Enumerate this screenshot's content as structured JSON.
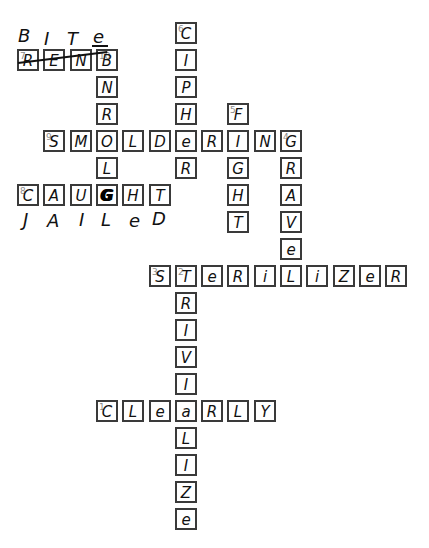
{
  "crossword": {
    "entries": [
      {
        "number": 1,
        "direction": "across",
        "answer": "CLEARLY",
        "row": 14,
        "col": 3
      },
      {
        "number": 2,
        "direction": "down",
        "answer": "TRIVIALIZE",
        "row": 9,
        "col": 6
      },
      {
        "number": 3,
        "direction": "across",
        "answer": "STERILIZER",
        "row": 9,
        "col": 5
      },
      {
        "number": 4,
        "direction": "down",
        "answer": "GRAVEL",
        "row": 4,
        "col": 10
      },
      {
        "number": 5,
        "direction": "down",
        "answer": "FIGHT",
        "row": 3,
        "col": 8
      },
      {
        "number": 6,
        "direction": "down",
        "answer": "CIPHER",
        "row": 0,
        "col": 6
      },
      {
        "number": 7,
        "direction": "across",
        "answer": "REND",
        "row": 1,
        "col": 0,
        "struck_through": true,
        "correction": "BITE"
      },
      {
        "number": 8,
        "direction": "across",
        "answer": "CAUGHT",
        "row": 6,
        "col": 0,
        "correction": "JAILED"
      },
      {
        "number": 9,
        "direction": "across",
        "answer": "SMOLDERING",
        "row": 4,
        "col": 1
      },
      {
        "number": 10,
        "direction": "down",
        "answer": "BNROLG",
        "row": 1,
        "col": 3
      }
    ],
    "cells": [
      {
        "r": 0,
        "c": 6,
        "letter": "C",
        "num": "6"
      },
      {
        "r": 1,
        "c": 0,
        "letter": "R",
        "num": "7"
      },
      {
        "r": 1,
        "c": 1,
        "letter": "E"
      },
      {
        "r": 1,
        "c": 2,
        "letter": "N"
      },
      {
        "r": 1,
        "c": 3,
        "letter": "B",
        "num": "10"
      },
      {
        "r": 1,
        "c": 6,
        "letter": "I"
      },
      {
        "r": 2,
        "c": 3,
        "letter": "N"
      },
      {
        "r": 2,
        "c": 6,
        "letter": "P"
      },
      {
        "r": 3,
        "c": 3,
        "letter": "R"
      },
      {
        "r": 3,
        "c": 6,
        "letter": "H"
      },
      {
        "r": 3,
        "c": 8,
        "letter": "F",
        "num": "5"
      },
      {
        "r": 4,
        "c": 1,
        "letter": "S",
        "num": "9"
      },
      {
        "r": 4,
        "c": 2,
        "letter": "M"
      },
      {
        "r": 4,
        "c": 3,
        "letter": "O"
      },
      {
        "r": 4,
        "c": 4,
        "letter": "L"
      },
      {
        "r": 4,
        "c": 5,
        "letter": "D"
      },
      {
        "r": 4,
        "c": 6,
        "letter": "e"
      },
      {
        "r": 4,
        "c": 7,
        "letter": "R"
      },
      {
        "r": 4,
        "c": 8,
        "letter": "I"
      },
      {
        "r": 4,
        "c": 9,
        "letter": "N"
      },
      {
        "r": 4,
        "c": 10,
        "letter": "G",
        "num": "4"
      },
      {
        "r": 5,
        "c": 3,
        "letter": "L"
      },
      {
        "r": 5,
        "c": 6,
        "letter": "R"
      },
      {
        "r": 5,
        "c": 8,
        "letter": "G"
      },
      {
        "r": 5,
        "c": 10,
        "letter": "R"
      },
      {
        "r": 6,
        "c": 0,
        "letter": "C",
        "num": "8"
      },
      {
        "r": 6,
        "c": 1,
        "letter": "A"
      },
      {
        "r": 6,
        "c": 2,
        "letter": "U"
      },
      {
        "r": 6,
        "c": 3,
        "letter": "G",
        "scribbled": true
      },
      {
        "r": 6,
        "c": 4,
        "letter": "H"
      },
      {
        "r": 6,
        "c": 5,
        "letter": "T"
      },
      {
        "r": 6,
        "c": 8,
        "letter": "H"
      },
      {
        "r": 6,
        "c": 10,
        "letter": "A"
      },
      {
        "r": 7,
        "c": 8,
        "letter": "T"
      },
      {
        "r": 7,
        "c": 10,
        "letter": "V"
      },
      {
        "r": 8,
        "c": 10,
        "letter": "e"
      },
      {
        "r": 9,
        "c": 5,
        "letter": "S",
        "num": "3"
      },
      {
        "r": 9,
        "c": 6,
        "letter": "T",
        "num": "2"
      },
      {
        "r": 9,
        "c": 7,
        "letter": "e"
      },
      {
        "r": 9,
        "c": 8,
        "letter": "R"
      },
      {
        "r": 9,
        "c": 9,
        "letter": "i"
      },
      {
        "r": 9,
        "c": 10,
        "letter": "L"
      },
      {
        "r": 9,
        "c": 11,
        "letter": "i"
      },
      {
        "r": 9,
        "c": 12,
        "letter": "Z"
      },
      {
        "r": 9,
        "c": 13,
        "letter": "e"
      },
      {
        "r": 9,
        "c": 14,
        "letter": "R"
      },
      {
        "r": 10,
        "c": 6,
        "letter": "R"
      },
      {
        "r": 11,
        "c": 6,
        "letter": "I"
      },
      {
        "r": 12,
        "c": 6,
        "letter": "V"
      },
      {
        "r": 13,
        "c": 6,
        "letter": "I"
      },
      {
        "r": 14,
        "c": 3,
        "letter": "C",
        "num": "1"
      },
      {
        "r": 14,
        "c": 4,
        "letter": "L"
      },
      {
        "r": 14,
        "c": 5,
        "letter": "e"
      },
      {
        "r": 14,
        "c": 6,
        "letter": "a"
      },
      {
        "r": 14,
        "c": 7,
        "letter": "R"
      },
      {
        "r": 14,
        "c": 8,
        "letter": "L"
      },
      {
        "r": 14,
        "c": 9,
        "letter": "Y"
      },
      {
        "r": 15,
        "c": 6,
        "letter": "L"
      },
      {
        "r": 16,
        "c": 6,
        "letter": "I"
      },
      {
        "r": 17,
        "c": 6,
        "letter": "Z"
      },
      {
        "r": 18,
        "c": 6,
        "letter": "e"
      }
    ],
    "corrections": {
      "above_7_across": {
        "text": "BITE",
        "letters": [
          {
            "ch": "B",
            "x": 18,
            "y": 27
          },
          {
            "ch": "I",
            "x": 44,
            "y": 30
          },
          {
            "ch": "T",
            "x": 67,
            "y": 30
          },
          {
            "ch": "e",
            "x": 93,
            "y": 28
          }
        ]
      },
      "below_8_across": {
        "text": "JAILED",
        "letters": [
          {
            "ch": "J",
            "x": 23,
            "y": 211
          },
          {
            "ch": "A",
            "x": 47,
            "y": 212
          },
          {
            "ch": "I",
            "x": 79,
            "y": 211
          },
          {
            "ch": "L",
            "x": 101,
            "y": 211
          },
          {
            "ch": "e",
            "x": 129,
            "y": 212
          },
          {
            "ch": "D",
            "x": 152,
            "y": 210
          }
        ]
      }
    },
    "layout": {
      "origin_x": 17,
      "origin_y": 22,
      "pitch_x": 26.3,
      "pitch_y": 27,
      "cell_size": 22
    },
    "colors": {
      "border": "#3a3a3a",
      "number": "#8a8a8a",
      "ink": "#111111",
      "background": "#ffffff"
    }
  }
}
